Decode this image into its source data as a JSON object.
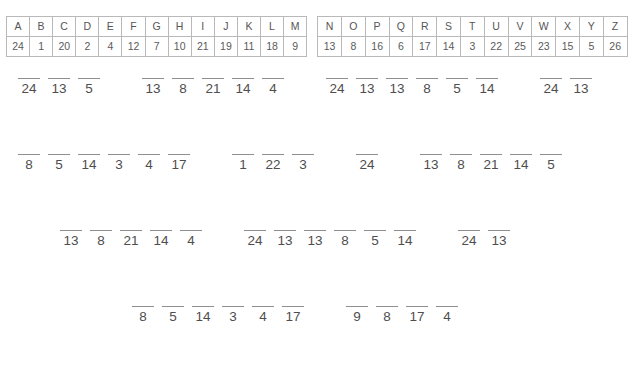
{
  "cipher_key": {
    "table_a": {
      "letters": [
        "A",
        "B",
        "C",
        "D",
        "E",
        "F",
        "G",
        "H",
        "I",
        "J",
        "K",
        "L",
        "M"
      ],
      "numbers": [
        "24",
        "1",
        "20",
        "2",
        "4",
        "12",
        "7",
        "10",
        "21",
        "19",
        "11",
        "18",
        "9"
      ]
    },
    "table_b": {
      "letters": [
        "N",
        "O",
        "P",
        "Q",
        "R",
        "S",
        "T",
        "U",
        "V",
        "W",
        "X",
        "Y",
        "Z"
      ],
      "numbers": [
        "13",
        "8",
        "16",
        "6",
        "17",
        "14",
        "3",
        "22",
        "25",
        "23",
        "15",
        "5",
        "26"
      ]
    }
  },
  "puzzle_rows": [
    {
      "groups": [
        {
          "numbers": [
            "24",
            "13",
            "5"
          ]
        },
        {
          "numbers": [
            "13",
            "8",
            "21",
            "14",
            "4"
          ]
        },
        {
          "numbers": [
            "24",
            "13",
            "13",
            "8",
            "5",
            "14"
          ]
        },
        {
          "numbers": [
            "24",
            "13"
          ]
        }
      ]
    },
    {
      "groups": [
        {
          "numbers": [
            "8",
            "5",
            "14",
            "3",
            "4",
            "17"
          ]
        },
        {
          "numbers": [
            "1",
            "22",
            "3"
          ]
        },
        {
          "numbers": [
            "24"
          ]
        },
        {
          "numbers": [
            "13",
            "8",
            "21",
            "14",
            "5"
          ]
        }
      ]
    },
    {
      "groups": [
        {
          "numbers": [
            "13",
            "8",
            "21",
            "14",
            "4"
          ]
        },
        {
          "numbers": [
            "24",
            "13",
            "13",
            "8",
            "5",
            "14"
          ]
        },
        {
          "numbers": [
            "24",
            "13"
          ]
        }
      ]
    },
    {
      "groups": [
        {
          "numbers": [
            "8",
            "5",
            "14",
            "3",
            "4",
            "17"
          ]
        },
        {
          "numbers": [
            "9",
            "8",
            "17",
            "4"
          ]
        }
      ]
    }
  ],
  "row_offsets": [
    "14px",
    "14px",
    "56px",
    "128px"
  ],
  "colors": {
    "text": "#4e4e4e",
    "rule": "#8e8e8e",
    "table_border": "#b9b9b9",
    "background": "#ffffff"
  }
}
